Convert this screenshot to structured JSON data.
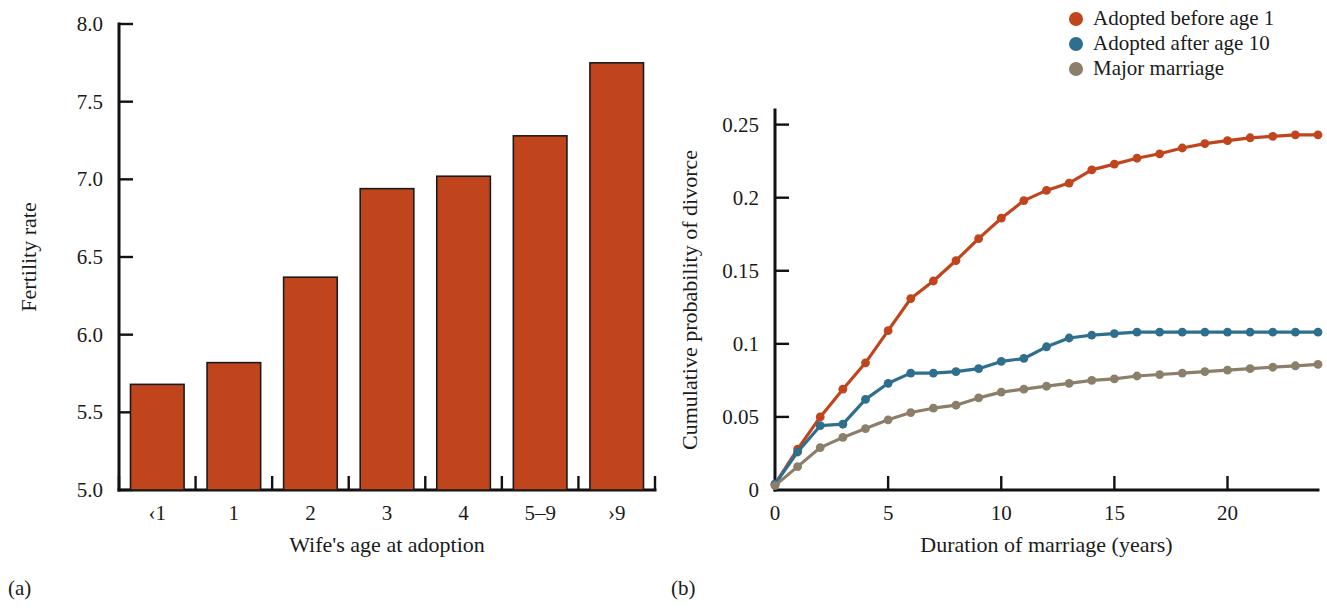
{
  "figure": {
    "panel_a_caption": "(a)",
    "panel_b_caption": "(b)"
  },
  "legend": {
    "position": "top-right",
    "items": [
      {
        "label": "Adopted before age 1",
        "color": "#C0451C"
      },
      {
        "label": "Adopted after age 10",
        "color": "#2E6F8E"
      },
      {
        "label": "Major marriage",
        "color": "#8C7F6A"
      }
    ]
  },
  "chart_data": [
    {
      "type": "bar",
      "panel": "(a)",
      "title": "",
      "xlabel": "Wife's age at adoption",
      "ylabel": "Fertility rate",
      "categories": [
        "‹1",
        "1",
        "2",
        "3",
        "4",
        "5–9",
        "›9"
      ],
      "values": [
        5.68,
        5.82,
        6.37,
        6.94,
        7.02,
        7.28,
        7.75
      ],
      "ylim": [
        5.0,
        8.0
      ],
      "yticks": [
        "5.0",
        "5.5",
        "6.0",
        "6.5",
        "7.0",
        "7.5",
        "8.0"
      ],
      "ytick_values": [
        5.0,
        5.5,
        6.0,
        6.5,
        7.0,
        7.5,
        8.0
      ],
      "bar_color": "#C0451C",
      "grid": false
    },
    {
      "type": "line",
      "panel": "(b)",
      "title": "",
      "xlabel": "Duration of marriage (years)",
      "ylabel": "Cumulative probability of divorce",
      "xlim": [
        0,
        24
      ],
      "ylim": [
        0,
        0.26
      ],
      "xticks": [
        "0",
        "5",
        "10",
        "15",
        "20"
      ],
      "xtick_values": [
        0,
        5,
        10,
        15,
        20
      ],
      "yticks": [
        "0",
        "0.05",
        "0.1",
        "0.15",
        "0.2",
        "0.25"
      ],
      "ytick_values": [
        0,
        0.05,
        0.1,
        0.15,
        0.2,
        0.25
      ],
      "x": [
        0,
        1,
        2,
        3,
        4,
        5,
        6,
        7,
        8,
        9,
        10,
        11,
        12,
        13,
        14,
        15,
        16,
        17,
        18,
        19,
        20,
        21,
        22,
        23,
        24
      ],
      "grid": false,
      "series": [
        {
          "name": "Adopted before age 1",
          "color": "#C0451C",
          "values": [
            0.004,
            0.028,
            0.05,
            0.069,
            0.087,
            0.109,
            0.131,
            0.143,
            0.157,
            0.172,
            0.186,
            0.198,
            0.205,
            0.21,
            0.219,
            0.223,
            0.227,
            0.23,
            0.234,
            0.237,
            0.239,
            0.241,
            0.242,
            0.243,
            0.243
          ]
        },
        {
          "name": "Adopted after age 10",
          "color": "#2E6F8E",
          "values": [
            0.004,
            0.026,
            0.044,
            0.045,
            0.062,
            0.073,
            0.08,
            0.08,
            0.081,
            0.083,
            0.088,
            0.09,
            0.098,
            0.104,
            0.106,
            0.107,
            0.108,
            0.108,
            0.108,
            0.108,
            0.108,
            0.108,
            0.108,
            0.108,
            0.108
          ]
        },
        {
          "name": "Major marriage",
          "color": "#8C7F6A",
          "values": [
            0.003,
            0.016,
            0.029,
            0.036,
            0.042,
            0.048,
            0.053,
            0.056,
            0.058,
            0.063,
            0.067,
            0.069,
            0.071,
            0.073,
            0.075,
            0.076,
            0.078,
            0.079,
            0.08,
            0.081,
            0.082,
            0.083,
            0.084,
            0.085,
            0.086
          ]
        }
      ]
    }
  ]
}
